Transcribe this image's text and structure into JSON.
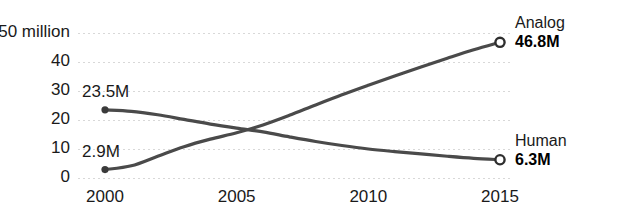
{
  "chart_data": {
    "type": "line",
    "title": "",
    "subtitle": "",
    "xlabel": "",
    "ylabel": "",
    "yunit_label": "50 million",
    "x": [
      2000,
      2001,
      2002,
      2003,
      2004,
      2005,
      2006,
      2007,
      2008,
      2009,
      2010,
      2011,
      2012,
      2013,
      2014,
      2015
    ],
    "xlim": [
      2000,
      2015
    ],
    "ylim": [
      0,
      50
    ],
    "xticks": [
      2000,
      2005,
      2010,
      2015
    ],
    "xtick_labels": [
      "2000",
      "2005",
      "2010",
      "2015"
    ],
    "yticks": [
      0,
      10,
      20,
      30,
      40,
      50
    ],
    "ytick_labels": [
      "0",
      "10",
      "20",
      "30",
      "40",
      "50 million"
    ],
    "grid": true,
    "grid_axis": "y",
    "grid_style": "dotted",
    "legend": "inline-endpoint-labels",
    "legend_position": "right",
    "series": [
      {
        "name": "Analog",
        "start_label": "2.9M",
        "start_value": 2.9,
        "end_label": "46.8M",
        "end_value": 46.8,
        "color": "#4a4a4a",
        "values": [
          2.9,
          4.2,
          7.5,
          10.8,
          13.4,
          15.6,
          18.3,
          21.6,
          25.2,
          28.7,
          32.0,
          35.2,
          38.3,
          41.3,
          44.2,
          46.8
        ]
      },
      {
        "name": "Human",
        "start_label": "23.5M",
        "start_value": 23.5,
        "end_label": "6.3M",
        "end_value": 6.3,
        "color": "#4a4a4a",
        "values": [
          23.5,
          23.0,
          21.8,
          20.2,
          18.6,
          17.2,
          15.9,
          14.2,
          12.6,
          11.2,
          10.0,
          9.1,
          8.3,
          7.5,
          6.8,
          6.3
        ]
      }
    ],
    "annotations": [
      {
        "text": "23.5M",
        "series": "Human",
        "at_x": 2000
      },
      {
        "text": "2.9M",
        "series": "Analog",
        "at_x": 2000
      }
    ],
    "colors": {
      "line": "#4a4a4a",
      "grid": "#d8d8d8",
      "text": "#1a1a1a",
      "background": "#ffffff",
      "marker_start_fill": "#3a3a3a",
      "marker_end_fill": "#ffffff",
      "marker_end_stroke": "#2e2e2e"
    }
  }
}
